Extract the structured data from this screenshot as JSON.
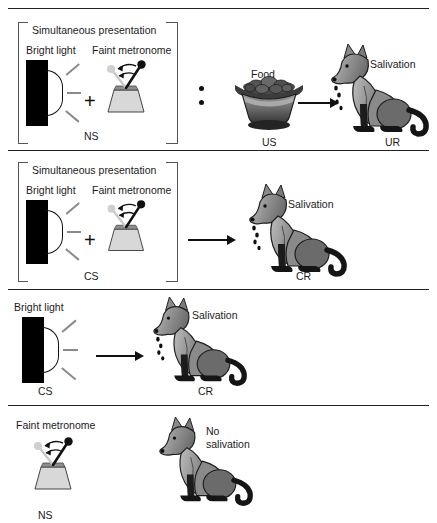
{
  "figure": {
    "title_present": false,
    "type": "classical-conditioning-diagram",
    "colors": {
      "ink": "#111111",
      "rule": "#222222",
      "light_bar": "#000000",
      "ray": "#8a8a8a",
      "metronome_base": "#d4d4d4",
      "metronome_arm": "#111111",
      "metronome_ghost": "#c9c9c9",
      "dog_body_light": "#b4b4b4",
      "dog_body_dark": "#6e6e6e",
      "dog_legs": "#1a1a1a",
      "bowl_dark": "#3a3a3a",
      "bowl_light": "#9a9a9a"
    }
  },
  "panels": [
    {
      "id": "panel-acquisition",
      "bracket_label": "Simultaneous presentation",
      "stimuli": [
        {
          "name": "bright-light",
          "label": "Bright light"
        },
        {
          "name": "faint-metronome",
          "label": "Faint metronome"
        }
      ],
      "plus": "+",
      "bracket_code": "NS",
      "pairing_symbol": ":",
      "us_label": "Food",
      "us_code": "US",
      "response_label": "Salivation",
      "response_code": "UR",
      "arrow": "→"
    },
    {
      "id": "panel-conditioned-compound",
      "bracket_label": "Simultaneous presentation",
      "stimuli": [
        {
          "name": "bright-light",
          "label": "Bright light"
        },
        {
          "name": "faint-metronome",
          "label": "Faint metronome"
        }
      ],
      "plus": "+",
      "bracket_code": "CS",
      "response_label": "Salivation",
      "response_code": "CR",
      "arrow": "→"
    },
    {
      "id": "panel-light-alone",
      "stimuli": [
        {
          "name": "bright-light",
          "label": "Bright light"
        }
      ],
      "stimulus_code": "CS",
      "response_label": "Salivation",
      "response_code": "CR",
      "arrow": "→"
    },
    {
      "id": "panel-metronome-alone",
      "stimuli": [
        {
          "name": "faint-metronome",
          "label": "Faint metronome"
        }
      ],
      "stimulus_code": "NS",
      "response_label": "No\nsalivation",
      "response_label_line1": "No",
      "response_label_line2": "salivation"
    }
  ]
}
